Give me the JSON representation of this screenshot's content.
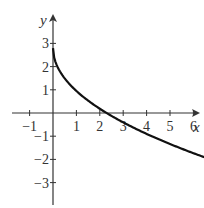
{
  "chart_data": {
    "type": "line",
    "title": "",
    "xlabel": "x",
    "ylabel": "y",
    "xlim": [
      -1.5,
      7
    ],
    "ylim": [
      -4,
      3.8
    ],
    "grid": false,
    "legend": null,
    "x_ticks": [
      -1,
      1,
      2,
      3,
      4,
      5,
      6
    ],
    "y_ticks": [
      3,
      2,
      1,
      -1,
      -2,
      -3
    ],
    "x_tick_labels": [
      "−1",
      "1",
      "2",
      "3",
      "4",
      "5",
      "6"
    ],
    "y_tick_labels": [
      "3",
      "2",
      "1",
      "−1",
      "−2",
      "−3"
    ],
    "series": [
      {
        "name": "curve",
        "color": "#111111",
        "x": [
          0,
          0.1,
          0.25,
          0.5,
          1,
          1.5,
          2,
          2.3,
          3,
          4,
          5,
          6,
          7
        ],
        "y": [
          2.8,
          2.2,
          1.88,
          1.5,
          0.95,
          0.53,
          0.18,
          0.0,
          -0.4,
          -0.9,
          -1.34,
          -1.73,
          -2.1
        ]
      }
    ]
  },
  "labels": {
    "x_axis": "x",
    "y_axis": "y"
  }
}
